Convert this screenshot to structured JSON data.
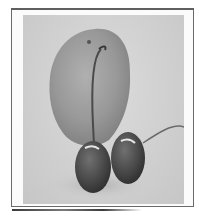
{
  "image": {
    "description": "Grayscale photograph of a lemon with two cherries and their stems, inside a thin rectangular frame",
    "subjects": [
      "lemon",
      "cherry",
      "cherry",
      "cherry-stem",
      "cherry-stem"
    ],
    "colors": {
      "frame": "#6a6a6a",
      "background": "#d2d2d2",
      "lemon": "#9a9a9a",
      "cherry": "#4a4a4a"
    }
  }
}
